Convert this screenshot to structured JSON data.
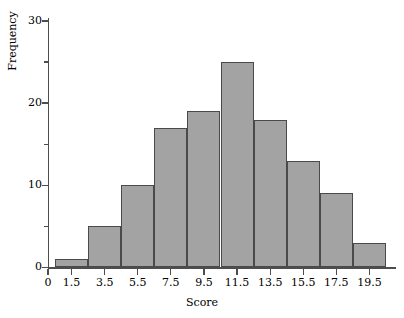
{
  "figure": {
    "background_color": "#ffffff",
    "axis_color": "#4d4d4d",
    "bar_fill_color": "#a3a3a3",
    "bar_edge_color": "#4a4a4a"
  },
  "chart_data": {
    "type": "bar",
    "title": "",
    "xlabel": "Score",
    "ylabel": "Frequency",
    "categories": [
      "1.5",
      "3.5",
      "5.5",
      "7.5",
      "9.5",
      "11.5",
      "13.5",
      "15.5",
      "17.5",
      "19.5"
    ],
    "values": [
      1,
      5,
      10,
      17,
      19,
      25,
      18,
      13,
      9,
      3
    ],
    "bin_width": 2,
    "bin_edges": [
      0.5,
      2.5,
      4.5,
      6.5,
      8.5,
      10.5,
      12.5,
      14.5,
      16.5,
      18.5,
      20.5
    ],
    "xlim": [
      0,
      21.5
    ],
    "ylim": [
      0,
      31
    ],
    "grid": false,
    "legend": null,
    "x_ticks": [
      "0",
      "1.5",
      "3.5",
      "5.5",
      "7.5",
      "9.5",
      "11.5",
      "13.5",
      "15.5",
      "17.5",
      "19.5"
    ],
    "x_tick_values": [
      0,
      1.5,
      3.5,
      5.5,
      7.5,
      9.5,
      11.5,
      13.5,
      15.5,
      17.5,
      19.5
    ],
    "y_ticks_major": [
      "0",
      "10",
      "20",
      "30"
    ],
    "y_tick_values_major": [
      0,
      10,
      20,
      30
    ],
    "y_tick_values_minor": [
      5,
      15,
      25
    ]
  }
}
